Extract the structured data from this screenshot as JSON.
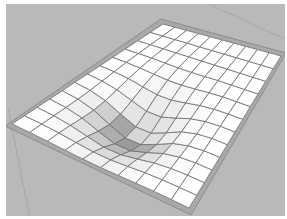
{
  "scene": {
    "title": "Deformed grid surface with central depression",
    "background_color": "#b9b9b9",
    "frame_color": "#a9a9a9",
    "frame_edge_color": "#8c8c8c",
    "grid_fill": "#ffffff",
    "grid_line_color": "#6e6e6e",
    "shadow_color": "#7a7a7a",
    "grid": {
      "columns": 12,
      "rows": 10,
      "corners": {
        "top": [
          163,
          24
        ],
        "right": [
          281,
          56
        ],
        "bottom": [
          189,
          208
        ],
        "left": [
          12,
          124
        ]
      }
    },
    "frame": {
      "corners": {
        "top": [
          161,
          19
        ],
        "right": [
          286,
          53
        ],
        "bottom": [
          191,
          215
        ],
        "left": [
          5,
          126
        ]
      }
    },
    "depression": {
      "center_uv": [
        0.36,
        0.45
      ],
      "radius": 0.28,
      "depth_px": 22
    },
    "guide_lines": [
      {
        "from": [
          8,
          108
        ],
        "to": [
          30,
          219
        ]
      },
      {
        "from": [
          200,
          0
        ],
        "to": [
          287,
          40
        ]
      }
    ]
  }
}
